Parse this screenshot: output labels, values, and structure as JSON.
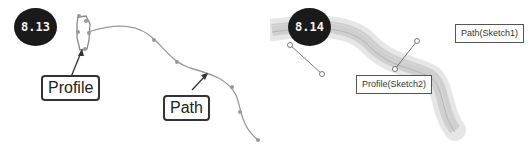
{
  "figures": [
    {
      "number": "8.13",
      "callouts": {
        "profile": "Profile",
        "path": "Path"
      }
    },
    {
      "number": "8.14",
      "callouts": {
        "profile": "Profile(Sketch2)",
        "path": "Path(Sketch1)"
      }
    }
  ],
  "colors": {
    "badge": "#1a1a1a",
    "curve": "#9a9a9a",
    "sweep": "#c8c8c8",
    "leader": "#333333"
  }
}
